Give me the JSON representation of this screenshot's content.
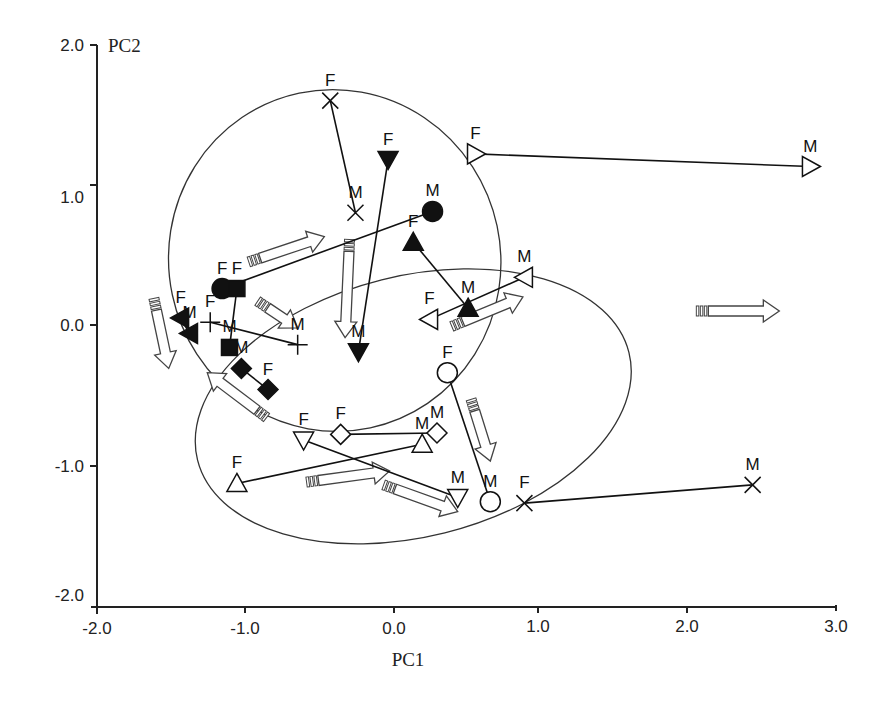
{
  "chart_data": {
    "type": "scatter",
    "title": "",
    "xlabel": "PC1",
    "ylabel": "PC2",
    "xlim": [
      -2.0,
      3.0
    ],
    "ylim": [
      -2.0,
      2.0
    ],
    "xticks": [
      "-2.0",
      "-1.0",
      "0.0",
      "1.0",
      "2.0",
      "3.0"
    ],
    "yticks": [
      "2.0",
      "1.0",
      "0.0",
      "-1.0",
      "-2.0"
    ],
    "grid": false,
    "legend": null,
    "point_labels": {
      "female": "F",
      "male": "M"
    },
    "pairs": [
      {
        "marker": "cross",
        "filled": false,
        "F": [
          -0.43,
          1.6
        ],
        "M": [
          -0.26,
          0.8
        ]
      },
      {
        "marker": "triangle-down",
        "filled": true,
        "F": [
          -0.04,
          1.18
        ],
        "M": [
          -0.24,
          -0.19
        ]
      },
      {
        "marker": "triangle-right",
        "filled": false,
        "F": [
          0.55,
          1.22
        ],
        "M": [
          2.81,
          1.13
        ]
      },
      {
        "marker": "circle",
        "filled": true,
        "F": [
          -1.16,
          0.26
        ],
        "M": [
          0.26,
          0.81
        ]
      },
      {
        "marker": "square",
        "filled": true,
        "F": [
          -1.06,
          0.26
        ],
        "M": [
          -1.11,
          -0.16
        ]
      },
      {
        "marker": "triangle-up",
        "filled": true,
        "F": [
          0.13,
          0.59
        ],
        "M": [
          0.5,
          0.12
        ]
      },
      {
        "marker": "triangle-left",
        "filled": false,
        "F": [
          0.24,
          0.04
        ],
        "M": [
          0.88,
          0.34
        ]
      },
      {
        "marker": "triangle-left",
        "filled": true,
        "F": [
          -1.44,
          0.05
        ],
        "M": [
          -1.38,
          -0.06
        ]
      },
      {
        "marker": "plus",
        "filled": false,
        "F": [
          -1.24,
          0.02
        ],
        "M": [
          -0.65,
          -0.14
        ]
      },
      {
        "marker": "diamond",
        "filled": true,
        "F": [
          -0.85,
          -0.46
        ],
        "M": [
          -1.03,
          -0.31
        ]
      },
      {
        "marker": "circle",
        "filled": false,
        "F": [
          0.36,
          -0.34
        ],
        "M": [
          0.65,
          -1.26
        ]
      },
      {
        "marker": "cross",
        "filled": false,
        "F": [
          0.88,
          -1.27
        ],
        "M": [
          2.42,
          -1.14
        ]
      },
      {
        "marker": "triangle-up",
        "filled": false,
        "F": [
          -1.06,
          -1.13
        ],
        "M": [
          0.19,
          -0.85
        ]
      },
      {
        "marker": "triangle-down",
        "filled": false,
        "F": [
          -0.61,
          -0.82
        ],
        "M": [
          0.43,
          -1.23
        ]
      },
      {
        "marker": "diamond",
        "filled": false,
        "F": [
          -0.36,
          -0.78
        ],
        "M": [
          0.29,
          -0.77
        ]
      }
    ],
    "ellipses": [
      {
        "name": "upper-group",
        "cx": -0.4,
        "cy": 0.46,
        "rx": 1.12,
        "ry": 1.22,
        "rotation_deg": -12
      },
      {
        "name": "lower-group",
        "cx": 0.13,
        "cy": -0.58,
        "rx": 1.5,
        "ry": 0.93,
        "rotation_deg": -14
      }
    ],
    "arrows": [
      {
        "from": [
          -0.98,
          0.45
        ],
        "to": [
          -0.47,
          0.63
        ]
      },
      {
        "from": [
          -0.3,
          0.61
        ],
        "to": [
          -0.33,
          -0.09
        ]
      },
      {
        "from": [
          -1.62,
          0.19
        ],
        "to": [
          -1.52,
          -0.31
        ]
      },
      {
        "from": [
          -0.92,
          0.17
        ],
        "to": [
          -0.65,
          -0.02
        ]
      },
      {
        "from": [
          -0.86,
          -0.66
        ],
        "to": [
          -1.26,
          -0.34
        ]
      },
      {
        "from": [
          0.39,
          -0.01
        ],
        "to": [
          0.87,
          0.2
        ]
      },
      {
        "from": [
          2.04,
          0.1
        ],
        "to": [
          2.6,
          0.1
        ]
      },
      {
        "from": [
          0.52,
          -0.53
        ],
        "to": [
          0.65,
          -0.97
        ]
      },
      {
        "from": [
          -0.59,
          -1.12
        ],
        "to": [
          -0.03,
          -1.04
        ]
      },
      {
        "from": [
          -0.07,
          -1.14
        ],
        "to": [
          0.43,
          -1.33
        ]
      }
    ]
  }
}
